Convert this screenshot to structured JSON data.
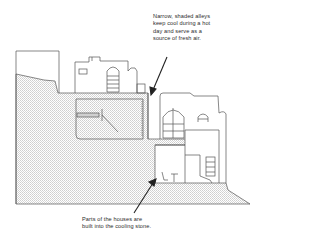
{
  "diagram": {
    "annotations": [
      {
        "id": "alleys",
        "text": "Narrow, shaded alleys\nkeep cool during a hot\nday and serve as a\nsource of fresh air."
      },
      {
        "id": "stone",
        "text": "Parts of the houses are\nbuilt into the cooling stone."
      }
    ],
    "colors": {
      "line": "#444444",
      "stone_fill": "#e6e6e6",
      "background": "#ffffff",
      "text": "#2b2b2b"
    }
  }
}
